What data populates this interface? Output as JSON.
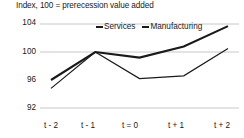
{
  "chart_data": {
    "type": "line",
    "title": "Index, 100 = prerecession value added",
    "xlabel": "",
    "ylabel": "",
    "categories": [
      "t - 2",
      "t - 1",
      "t = 0",
      "t + 1",
      "t + 2"
    ],
    "series": [
      {
        "name": "Services",
        "values": [
          96.0,
          100.0,
          99.2,
          100.8,
          103.7
        ],
        "color": "#1a1a1a",
        "line_width": 2.1
      },
      {
        "name": "Manufacturing",
        "values": [
          94.8,
          100.0,
          96.2,
          96.6,
          100.5
        ],
        "color": "#1a1a1a",
        "line_width": 1.2
      }
    ],
    "yticks": [
      104,
      100,
      96,
      92
    ],
    "ylim": [
      92,
      104
    ],
    "grid": true,
    "gridlines_at": [
      104,
      100,
      92
    ],
    "grid_color": "#c8c8c8",
    "legend_position": "top-center",
    "legend": [
      "Services",
      "Manufacturing"
    ]
  },
  "axis": {
    "y_labels": [
      "104",
      "100",
      "96",
      "92"
    ],
    "x_labels": [
      "t - 2",
      "t - 1",
      "t = 0",
      "t + 1",
      "t + 2"
    ]
  },
  "legend": {
    "items": [
      {
        "label": "Services"
      },
      {
        "label": "Manufacturing"
      }
    ]
  }
}
